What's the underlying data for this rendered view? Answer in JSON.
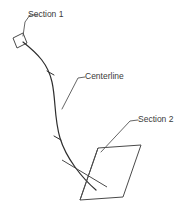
{
  "diagram": {
    "type": "cad-loft-section-diagram",
    "background_color": "#ffffff",
    "line_color": "#3c3c3c",
    "text_color": "#3a3a3a",
    "annotations": [
      {
        "id": "section-1",
        "label": "Section 1",
        "text_x": 28,
        "text_y": 15,
        "leader_points": "23,36 25,22 30,15 38,15"
      },
      {
        "id": "centerline",
        "label": "Centerline",
        "text_x": 85,
        "text_y": 77,
        "leader_points": "62,109 78,78 85,77"
      },
      {
        "id": "section-2",
        "label": "Section 2",
        "text_x": 138,
        "text_y": 120,
        "leader_points": "101,152 130,121 138,120"
      }
    ],
    "section_1_profile": {
      "name": "Section 1",
      "points": "13,38 23,33 27,43 17,48",
      "closed": true
    },
    "section_2_profile": {
      "name": "Section 2",
      "points": "98,148 141,145 123,197 80,200",
      "closed": true,
      "diagonals": [
        "62,160 107,187",
        "98,148 80,200"
      ]
    },
    "centerline_path": {
      "name": "Centerline",
      "d": "M 23,42 C 38,54 48,64 52,82 C 56,100 54,118 60,138 C 66,158 82,178 96,190",
      "tick_marks": [
        "47,71 54,75",
        "54,136 61,140"
      ]
    }
  }
}
